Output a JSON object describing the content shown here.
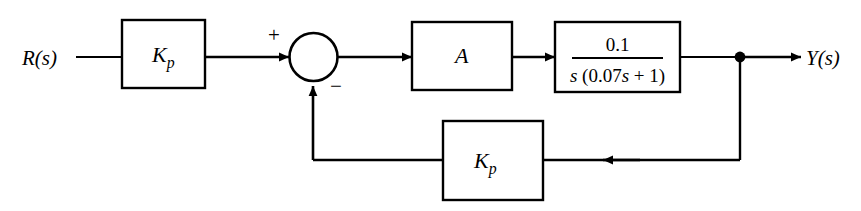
{
  "diagram": {
    "type": "control-system-block-diagram",
    "background_color": "#ffffff",
    "line_color": "#000000",
    "signals": {
      "input_label": "R(s)",
      "output_label": "Y(s)"
    },
    "summing_junction": {
      "name": "summing-junction",
      "plus_sign": "+",
      "minus_sign": "−",
      "plus_input": "forward path from gain Kp",
      "minus_input": "feedback path from gain Kp"
    },
    "blocks": [
      {
        "id": "forward-gain",
        "label_main": "K",
        "label_sub": "p",
        "label_plain": "Kp",
        "role": "forward path proportional gain"
      },
      {
        "id": "amplifier",
        "label_main": "A",
        "label_sub": "",
        "label_plain": "A",
        "role": "amplifier gain"
      },
      {
        "id": "plant",
        "label_plain": "0.1 / s (0.07s + 1)",
        "numerator": "0.1",
        "denominator_s": "s",
        "denominator_paren_open": "(",
        "denominator_coeff": "0.07",
        "denominator_var": "s",
        "denominator_plus": "+",
        "denominator_const": "1",
        "denominator_paren_close": ")",
        "role": "plant transfer function"
      },
      {
        "id": "feedback-gain",
        "label_main": "K",
        "label_sub": "p",
        "label_plain": "Kp",
        "role": "feedback path proportional gain"
      }
    ],
    "nodes": [
      {
        "id": "output-takeoff",
        "label": "output take-off point"
      }
    ]
  }
}
